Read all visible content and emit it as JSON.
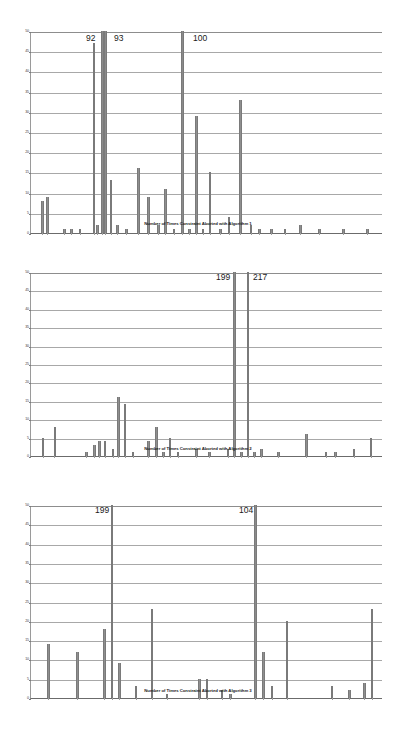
{
  "page": {
    "background_color": "#ffffff",
    "bar_color": "#8f8f8f",
    "grid_color": "#a8a8a8",
    "axis_color": "#6b6b6b",
    "text_color": "#1a1a1a"
  },
  "chart_data": [
    {
      "id": "algorithm-1",
      "type": "bar",
      "title": "",
      "xlabel": "Number of Times Constraint Aborted with Algorithm 1",
      "ylabel": "",
      "ylim": [
        0,
        50
      ],
      "yticks": [
        0,
        5,
        10,
        15,
        20,
        25,
        30,
        35,
        40,
        45,
        50
      ],
      "grid": true,
      "legend": "none",
      "annotations": [
        {
          "text": "92",
          "x": 92,
          "value": 92
        },
        {
          "text": "93",
          "x": 93,
          "value": 93
        },
        {
          "text": "100",
          "x": 100,
          "value": 100
        }
      ],
      "x": [
        6,
        9,
        19,
        23,
        28,
        36,
        38,
        41,
        43,
        46,
        50,
        55,
        62,
        68,
        74,
        78,
        83,
        88,
        92,
        96,
        100,
        104,
        110,
        115,
        122,
        128,
        133,
        140,
        148,
        157,
        168,
        182,
        196
      ],
      "values": [
        8,
        9,
        1,
        1,
        1,
        47,
        2,
        50,
        50,
        13,
        2,
        1,
        16,
        9,
        2,
        11,
        1,
        50,
        1,
        29,
        1,
        15,
        1,
        4,
        33,
        2,
        1,
        1,
        1,
        2,
        1,
        1,
        1
      ],
      "clipped": [
        false,
        false,
        false,
        false,
        false,
        false,
        false,
        true,
        true,
        false,
        false,
        false,
        false,
        false,
        false,
        false,
        false,
        true,
        false,
        false,
        false,
        false,
        false,
        false,
        false,
        false,
        false,
        false,
        false,
        false,
        false,
        false,
        false
      ]
    },
    {
      "id": "algorithm-2",
      "type": "bar",
      "title": "",
      "xlabel": "Number of Times Constraint Aborted with Algorithm 2",
      "ylabel": "",
      "ylim": [
        0,
        50
      ],
      "yticks": [
        0,
        5,
        10,
        15,
        20,
        25,
        30,
        35,
        40,
        45,
        50
      ],
      "grid": true,
      "legend": "none",
      "annotations": [
        {
          "text": "199",
          "x": 199,
          "value": 199
        },
        {
          "text": "217",
          "x": 217,
          "value": 217
        }
      ],
      "x": [
        8,
        17,
        41,
        47,
        51,
        55,
        61,
        65,
        70,
        76,
        88,
        94,
        99,
        104,
        110,
        124,
        134,
        148,
        153,
        158,
        163,
        168,
        173,
        186,
        207,
        222,
        229,
        243,
        256
      ],
      "values": [
        5,
        8,
        1,
        3,
        4,
        4,
        2,
        16,
        14,
        1,
        4,
        8,
        1,
        5,
        1,
        2,
        1,
        2,
        50,
        1,
        50,
        1,
        2,
        1,
        6,
        1,
        1,
        2,
        5
      ],
      "clipped": [
        false,
        false,
        false,
        false,
        false,
        false,
        false,
        false,
        false,
        false,
        false,
        false,
        false,
        false,
        false,
        false,
        false,
        false,
        true,
        false,
        true,
        false,
        false,
        false,
        false,
        false,
        false,
        false,
        false
      ]
    },
    {
      "id": "algorithm-3",
      "type": "bar",
      "title": "",
      "xlabel": "Number of Times Constraint Aborted with Algorithm 3",
      "ylabel": "",
      "ylim": [
        0,
        50
      ],
      "yticks": [
        0,
        5,
        10,
        15,
        20,
        25,
        30,
        35,
        40,
        45,
        50
      ],
      "grid": true,
      "legend": "none",
      "annotations": [
        {
          "text": "199",
          "x": 199,
          "value": 199
        },
        {
          "text": "104",
          "x": 104,
          "value": 104
        }
      ],
      "x": [
        13,
        36,
        58,
        64,
        70,
        83,
        96,
        108,
        134,
        140,
        152,
        159,
        179,
        185,
        192,
        204,
        240,
        254,
        266,
        272
      ],
      "values": [
        14,
        12,
        18,
        50,
        9,
        3,
        23,
        1,
        5,
        5,
        2,
        1,
        50,
        12,
        3,
        20,
        3,
        2,
        4,
        23
      ],
      "clipped": [
        false,
        false,
        false,
        true,
        false,
        false,
        false,
        false,
        false,
        false,
        false,
        false,
        true,
        false,
        false,
        false,
        false,
        false,
        false,
        false
      ]
    }
  ]
}
